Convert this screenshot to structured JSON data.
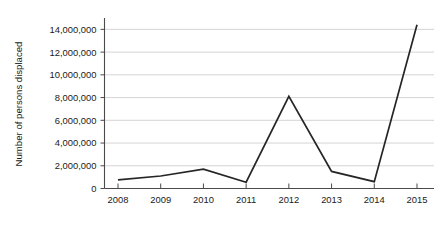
{
  "chart_data": {
    "type": "line",
    "title": "",
    "subtitle": "",
    "xlabel": "",
    "ylabel": "Number of persons displaced",
    "categories": [
      "2008",
      "2009",
      "2010",
      "2011",
      "2012",
      "2013",
      "2014",
      "2015"
    ],
    "x": [
      2008,
      2009,
      2010,
      2011,
      2012,
      2013,
      2014,
      2015
    ],
    "values": [
      750000,
      1100000,
      1700000,
      550000,
      8100000,
      1500000,
      600000,
      14400000
    ],
    "series": [
      {
        "name": "Number of persons displaced",
        "values": [
          750000,
          1100000,
          1700000,
          550000,
          8100000,
          1500000,
          600000,
          14400000
        ]
      }
    ],
    "ylim": [
      0,
      15000000
    ],
    "ytick_values": [
      0,
      2000000,
      4000000,
      6000000,
      8000000,
      10000000,
      12000000,
      14000000
    ],
    "ytick_labels": [
      "0",
      "2,000,000",
      "4,000,000",
      "6,000,000",
      "8,000,000",
      "10,000,000",
      "12,000,000",
      "14,000,000"
    ],
    "grid": true,
    "grid_axis": "y",
    "legend": false,
    "legend_position": "none",
    "annotations": [],
    "line_color": "#262626",
    "grid_color": "#c9c9c9",
    "axis_color": "#4a4a4a",
    "background_color": "#ffffff"
  }
}
